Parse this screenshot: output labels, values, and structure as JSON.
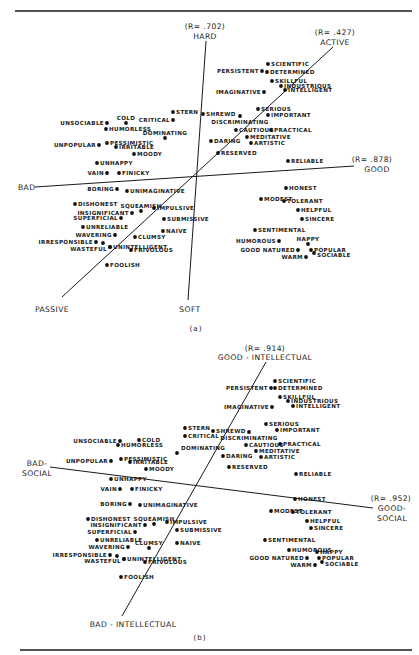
{
  "figure": {
    "panels": [
      {
        "id": "a",
        "caption": "(a)",
        "caption_pos": [
          196,
          331
        ],
        "axes": [
          {
            "name": "hard-soft",
            "line": [
              206,
              41,
              188,
              300
            ],
            "labels": [
              {
                "text": "(R= .702)",
                "x": 205,
                "y": 29
              },
              {
                "text": "HARD",
                "x": 205,
                "y": 39
              },
              {
                "text": "SOFT",
                "x": 190,
                "y": 312
              }
            ]
          },
          {
            "name": "active-passive",
            "line": [
              333,
              47,
              62,
              297
            ],
            "labels": [
              {
                "text": "(R= .427)",
                "x": 335,
                "y": 35
              },
              {
                "text": "ACTIVE",
                "x": 335,
                "y": 45
              },
              {
                "text": "PASSIVE",
                "x": 52,
                "y": 312
              }
            ]
          },
          {
            "name": "good-bad",
            "line": [
              35,
              187,
              354,
              166
            ],
            "labels": [
              {
                "text": "(R= .878)",
                "x": 372,
                "y": 162
              },
              {
                "text": "GOOD",
                "x": 377,
                "y": 172
              },
              {
                "text": "BAD",
                "x": 18,
                "y": 190,
                "anchor": "start"
              }
            ]
          }
        ],
        "points": [
          {
            "label": "SCIENTIFIC",
            "x": 268,
            "y": 64,
            "side": "r"
          },
          {
            "label": "PERSISTENT",
            "x": 262,
            "y": 71,
            "side": "l"
          },
          {
            "label": "DETERMINED",
            "x": 267,
            "y": 72,
            "side": "r"
          },
          {
            "label": "SKILLFUL",
            "x": 272,
            "y": 81,
            "side": "r"
          },
          {
            "label": "INDUSTRIOUS",
            "x": 281,
            "y": 86,
            "side": "r"
          },
          {
            "label": "INTELLIGENT",
            "x": 285,
            "y": 90,
            "side": "r"
          },
          {
            "label": "IMAGINATIVE",
            "x": 264,
            "y": 92,
            "side": "l"
          },
          {
            "label": "SERIOUS",
            "x": 258,
            "y": 109,
            "side": "r"
          },
          {
            "label": "IMPORTANT",
            "x": 268,
            "y": 115,
            "side": "r"
          },
          {
            "label": "STERN",
            "x": 173,
            "y": 112,
            "side": "r"
          },
          {
            "label": "SHREWD",
            "x": 203,
            "y": 114,
            "side": "r"
          },
          {
            "label": "DISCRIMINATING",
            "x": 240,
            "y": 116,
            "side": "b"
          },
          {
            "label": "CRITICAL",
            "x": 173,
            "y": 120,
            "side": "l"
          },
          {
            "label": "COLD",
            "x": 126,
            "y": 123,
            "side": "t"
          },
          {
            "label": "UNSOCIABLE",
            "x": 107,
            "y": 123,
            "side": "l"
          },
          {
            "label": "HUMORLESS",
            "x": 106,
            "y": 129,
            "side": "r"
          },
          {
            "label": "DOMINATING",
            "x": 165,
            "y": 138,
            "side": "t"
          },
          {
            "label": "CAUTIOUS",
            "x": 236,
            "y": 130,
            "side": "r"
          },
          {
            "label": "PRACTICAL",
            "x": 271,
            "y": 130,
            "side": "r"
          },
          {
            "label": "MEDITATIVE",
            "x": 247,
            "y": 137,
            "side": "r"
          },
          {
            "label": "ARTISTIC",
            "x": 251,
            "y": 143,
            "side": "r"
          },
          {
            "label": "DARING",
            "x": 211,
            "y": 141,
            "side": "r"
          },
          {
            "label": "PESSIMISTIC",
            "x": 107,
            "y": 143,
            "side": "r"
          },
          {
            "label": "UNPOPULAR",
            "x": 99,
            "y": 145,
            "side": "l"
          },
          {
            "label": "IRRITABLE",
            "x": 116,
            "y": 147,
            "side": "r"
          },
          {
            "label": "MOODY",
            "x": 134,
            "y": 154,
            "side": "r"
          },
          {
            "label": "RESERVED",
            "x": 218,
            "y": 153,
            "side": "r"
          },
          {
            "label": "RELIABLE",
            "x": 288,
            "y": 161,
            "side": "r"
          },
          {
            "label": "UNHAPPY",
            "x": 97,
            "y": 163,
            "side": "r"
          },
          {
            "label": "VAIN",
            "x": 107,
            "y": 173,
            "side": "l"
          },
          {
            "label": "FINICKY",
            "x": 119,
            "y": 173,
            "side": "r"
          },
          {
            "label": "BORING",
            "x": 117,
            "y": 189,
            "side": "l"
          },
          {
            "label": "UNIMAGINATIVE",
            "x": 127,
            "y": 191,
            "side": "r"
          },
          {
            "label": "HONEST",
            "x": 286,
            "y": 188,
            "side": "r"
          },
          {
            "label": "MODEST",
            "x": 261,
            "y": 199,
            "side": "r"
          },
          {
            "label": "TOLERANT",
            "x": 284,
            "y": 201,
            "side": "r"
          },
          {
            "label": "DISHONEST",
            "x": 75,
            "y": 204,
            "side": "r"
          },
          {
            "label": "SQUEAMISH",
            "x": 141,
            "y": 211,
            "side": "t"
          },
          {
            "label": "INSIGNIFICANT",
            "x": 132,
            "y": 213,
            "side": "l"
          },
          {
            "label": "IMPULSIVE",
            "x": 154,
            "y": 208,
            "side": "r"
          },
          {
            "label": "HELPFUL",
            "x": 298,
            "y": 210,
            "side": "r"
          },
          {
            "label": "SUPERFICIAL",
            "x": 121,
            "y": 218,
            "side": "l"
          },
          {
            "label": "SINCERE",
            "x": 302,
            "y": 219,
            "side": "r"
          },
          {
            "label": "SUBMISSIVE",
            "x": 164,
            "y": 219,
            "side": "r"
          },
          {
            "label": "UNRELIABLE",
            "x": 83,
            "y": 227,
            "side": "r"
          },
          {
            "label": "NAIVE",
            "x": 163,
            "y": 231,
            "side": "r"
          },
          {
            "label": "SENTIMENTAL",
            "x": 255,
            "y": 230,
            "side": "r"
          },
          {
            "label": "WAVERING",
            "x": 115,
            "y": 235,
            "side": "l"
          },
          {
            "label": "CLUMSY",
            "x": 135,
            "y": 237,
            "side": "r"
          },
          {
            "label": "HUMOROUS",
            "x": 279,
            "y": 241,
            "side": "l"
          },
          {
            "label": "HAPPY",
            "x": 308,
            "y": 244,
            "side": "t"
          },
          {
            "label": "IRRESPONSIBLE",
            "x": 96,
            "y": 242,
            "side": "l"
          },
          {
            "label": "",
            "x": 103,
            "y": 243,
            "side": "r"
          },
          {
            "label": "UNINTELLIGENT",
            "x": 110,
            "y": 247,
            "side": "r"
          },
          {
            "label": "WASTEFUL",
            "x": 110,
            "y": 247,
            "side": "L2"
          },
          {
            "label": "POPULAR",
            "x": 311,
            "y": 250,
            "side": "r"
          },
          {
            "label": "GOOD NATURED",
            "x": 298,
            "y": 250,
            "side": "l"
          },
          {
            "label": "FRIVOLOUS",
            "x": 131,
            "y": 250,
            "side": "r"
          },
          {
            "label": "SOCIABLE",
            "x": 314,
            "y": 253,
            "side": "rb"
          },
          {
            "label": "WARM",
            "x": 306,
            "y": 257,
            "side": "l"
          },
          {
            "label": "FOOLISH",
            "x": 107,
            "y": 265,
            "side": "r"
          }
        ]
      },
      {
        "id": "b",
        "caption": "(b)",
        "caption_pos": [
          200,
          640
        ],
        "axes": [
          {
            "name": "good-bad-intellectual",
            "line": [
              266,
              362,
              122,
              616
            ],
            "labels": [
              {
                "text": "(R= .914)",
                "x": 265,
                "y": 351
              },
              {
                "text": "GOOD - INTELLECTUAL",
                "x": 265,
                "y": 360
              },
              {
                "text": "BAD - INTELLECTUAL",
                "x": 133,
                "y": 627
              }
            ]
          },
          {
            "name": "good-bad-social",
            "line": [
              50,
              467,
              373,
              508
            ],
            "labels": [
              {
                "text": "(R= .952)",
                "x": 391,
                "y": 501
              },
              {
                "text": "GOOD-",
                "x": 392,
                "y": 511
              },
              {
                "text": "SOCIAL",
                "x": 392,
                "y": 521
              },
              {
                "text": "BAD-",
                "x": 37,
                "y": 466
              },
              {
                "text": "SOCIAL",
                "x": 37,
                "y": 476
              }
            ]
          }
        ],
        "axis_gaps": [
          [
            1,
            145,
            473,
            112
          ],
          [
            1,
            288,
            498,
            318
          ]
        ],
        "points": [
          {
            "label": "SCIENTIFIC",
            "x": 275,
            "y": 381,
            "side": "r"
          },
          {
            "label": "PERSISTENT",
            "x": 271,
            "y": 388,
            "side": "l"
          },
          {
            "label": "DETERMINED",
            "x": 275,
            "y": 388,
            "side": "r"
          },
          {
            "label": "SKILLFUL",
            "x": 280,
            "y": 397,
            "side": "r"
          },
          {
            "label": "INDUSTRIOUS",
            "x": 288,
            "y": 401,
            "side": "r"
          },
          {
            "label": "INTELLIGENT",
            "x": 293,
            "y": 406,
            "side": "r"
          },
          {
            "label": "IMAGINATIVE",
            "x": 272,
            "y": 407,
            "side": "l"
          },
          {
            "label": "SERIOUS",
            "x": 266,
            "y": 424,
            "side": "r"
          },
          {
            "label": "IMPORTANT",
            "x": 277,
            "y": 430,
            "side": "r"
          },
          {
            "label": "STERN",
            "x": 185,
            "y": 428,
            "side": "r"
          },
          {
            "label": "SHREWD",
            "x": 213,
            "y": 431,
            "side": "r"
          },
          {
            "label": "DISCRIMINATING",
            "x": 249,
            "y": 432,
            "side": "b"
          },
          {
            "label": "CRITICAL",
            "x": 185,
            "y": 436,
            "side": "r"
          },
          {
            "label": "UNSOCIABLE",
            "x": 120,
            "y": 441,
            "side": "l"
          },
          {
            "label": "COLD",
            "x": 139,
            "y": 440,
            "side": "r"
          },
          {
            "label": "HUMORLESS",
            "x": 118,
            "y": 445,
            "side": "r"
          },
          {
            "label": "CAUTIOUS",
            "x": 246,
            "y": 445,
            "side": "r"
          },
          {
            "label": "PRACTICAL",
            "x": 280,
            "y": 444,
            "side": "r"
          },
          {
            "label": "DOMINATING",
            "x": 177,
            "y": 453,
            "side": "tr"
          },
          {
            "label": "MEDITATIVE",
            "x": 256,
            "y": 451,
            "side": "r"
          },
          {
            "label": "ARTISTIC",
            "x": 261,
            "y": 457,
            "side": "r"
          },
          {
            "label": "DARING",
            "x": 223,
            "y": 456,
            "side": "r"
          },
          {
            "label": "PESSIMISTIC",
            "x": 121,
            "y": 459,
            "side": "r"
          },
          {
            "label": "UNPOPULAR",
            "x": 111,
            "y": 461,
            "side": "l"
          },
          {
            "label": "IRRITABLE",
            "x": 130,
            "y": 462,
            "side": "r"
          },
          {
            "label": "MOODY",
            "x": 146,
            "y": 469,
            "side": "r"
          },
          {
            "label": "RESERVED",
            "x": 229,
            "y": 467,
            "side": "r"
          },
          {
            "label": "RELIABLE",
            "x": 296,
            "y": 474,
            "side": "r"
          },
          {
            "label": "UNHAPPY",
            "x": 111,
            "y": 479,
            "side": "r"
          },
          {
            "label": "VAIN",
            "x": 120,
            "y": 489,
            "side": "l"
          },
          {
            "label": "FINICKY",
            "x": 132,
            "y": 489,
            "side": "r"
          },
          {
            "label": "BORING",
            "x": 130,
            "y": 504,
            "side": "l"
          },
          {
            "label": "UNIMAGINATIVE",
            "x": 140,
            "y": 505,
            "side": "r"
          },
          {
            "label": "HONEST",
            "x": 295,
            "y": 499,
            "side": "r"
          },
          {
            "label": "MODEST",
            "x": 271,
            "y": 511,
            "side": "r"
          },
          {
            "label": "TOLERANT",
            "x": 293,
            "y": 512,
            "side": "r"
          },
          {
            "label": "DISHONEST",
            "x": 88,
            "y": 519,
            "side": "r"
          },
          {
            "label": "SQUEAMISH",
            "x": 154,
            "y": 524,
            "side": "t"
          },
          {
            "label": "INSIGNIFICANT",
            "x": 145,
            "y": 525,
            "side": "l"
          },
          {
            "label": "IMPULSIVE",
            "x": 167,
            "y": 522,
            "side": "r"
          },
          {
            "label": "HELPFUL",
            "x": 307,
            "y": 521,
            "side": "r"
          },
          {
            "label": "SINCERE",
            "x": 311,
            "y": 528,
            "side": "r"
          },
          {
            "label": "SUPERFICIAL",
            "x": 135,
            "y": 532,
            "side": "l"
          },
          {
            "label": "SUBMISSIVE",
            "x": 177,
            "y": 530,
            "side": "r"
          },
          {
            "label": "UNRELIABLE",
            "x": 97,
            "y": 540,
            "side": "r"
          },
          {
            "label": "SENTIMENTAL",
            "x": 265,
            "y": 540,
            "side": "r"
          },
          {
            "label": "CLUMSY",
            "x": 149,
            "y": 548,
            "side": "t"
          },
          {
            "label": "NAIVE",
            "x": 177,
            "y": 543,
            "side": "r"
          },
          {
            "label": "WAVERING",
            "x": 128,
            "y": 547,
            "side": "l"
          },
          {
            "label": "HUMOROUS",
            "x": 289,
            "y": 550,
            "side": "r"
          },
          {
            "label": "HAPPY",
            "x": 317,
            "y": 552,
            "side": "r"
          },
          {
            "label": "IRRESPONSIBLE",
            "x": 110,
            "y": 555,
            "side": "l"
          },
          {
            "label": "",
            "x": 117,
            "y": 556,
            "side": "r"
          },
          {
            "label": "UNINTELLIGENT",
            "x": 124,
            "y": 559,
            "side": "r"
          },
          {
            "label": "WASTEFUL",
            "x": 124,
            "y": 559,
            "side": "L2"
          },
          {
            "label": "POPULAR",
            "x": 319,
            "y": 558,
            "side": "r"
          },
          {
            "label": "GOOD NATURED",
            "x": 307,
            "y": 558,
            "side": "l"
          },
          {
            "label": "FRIVOLOUS",
            "x": 145,
            "y": 562,
            "side": "r"
          },
          {
            "label": "SOCIABLE",
            "x": 322,
            "y": 562,
            "side": "rb"
          },
          {
            "label": "WARM",
            "x": 315,
            "y": 565,
            "side": "l"
          },
          {
            "label": "FOOLISH",
            "x": 121,
            "y": 577,
            "side": "r"
          }
        ]
      }
    ],
    "rules": [
      [
        15,
        11,
        412,
        11
      ],
      [
        20,
        650,
        412,
        650
      ]
    ]
  }
}
